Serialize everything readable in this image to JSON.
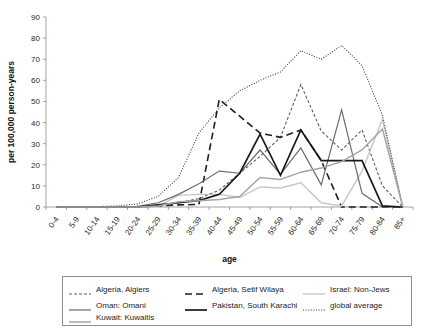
{
  "chart_data": {
    "type": "line",
    "title": "",
    "xlabel": "age",
    "ylabel": "per 100,000 person-years",
    "ylim": [
      0,
      90
    ],
    "ytick_step": 10,
    "yticks": [
      0,
      10,
      20,
      30,
      40,
      50,
      60,
      70,
      80,
      90
    ],
    "grid": false,
    "legend_position": "bottom",
    "categories": [
      "0-4",
      "5-9",
      "10-14",
      "15-19",
      "20-24",
      "25-29",
      "30-34",
      "35-39",
      "40-44",
      "45-49",
      "50-54",
      "55-59",
      "60-64",
      "65-69",
      "70-74",
      "75-79",
      "80-84",
      "85+"
    ],
    "series": [
      {
        "name": "Algeria, Algiers",
        "color": "#5e5e5e",
        "style": "dashed-dot",
        "dasharray": "3,2",
        "width": 1.1,
        "values": [
          0,
          0,
          0,
          0,
          0.3,
          1.0,
          2.0,
          4.0,
          8.0,
          16.0,
          24.0,
          33.0,
          58.0,
          36.0,
          27.0,
          36.5,
          10.0,
          0
        ]
      },
      {
        "name": "Algeria, Setif Wilaya",
        "color": "#1f1f1f",
        "style": "long-dash",
        "dasharray": "7,4",
        "width": 1.6,
        "values": [
          0,
          0,
          0,
          0,
          0,
          0.5,
          1.0,
          1.2,
          51.0,
          43.0,
          35.0,
          33.0,
          36.5,
          22.0,
          0,
          0,
          0,
          0
        ]
      },
      {
        "name": "Israel: Non-Jews",
        "color": "#c7c7c7",
        "style": "solid",
        "dasharray": "none",
        "width": 1.4,
        "values": [
          0,
          0,
          0,
          0,
          0,
          0.5,
          5.5,
          6.0,
          6.0,
          4.5,
          9.5,
          9.0,
          11.5,
          2.0,
          0.5,
          17.0,
          41.5,
          0
        ]
      },
      {
        "name": "Oman: Omani",
        "color": "#6b6b6b",
        "style": "solid",
        "dasharray": "none",
        "width": 1.2,
        "values": [
          0,
          0,
          0,
          0,
          0.3,
          2.0,
          6.0,
          11.0,
          17.0,
          16.0,
          27.0,
          15.5,
          28.0,
          10.5,
          46.0,
          6.5,
          0,
          0
        ]
      },
      {
        "name": "Pakistan, South Karachi",
        "color": "#1a1a1a",
        "style": "solid",
        "dasharray": "none",
        "width": 1.7,
        "values": [
          0,
          0,
          0,
          0,
          0,
          1.0,
          2.0,
          3.0,
          6.0,
          16.0,
          34.5,
          15.0,
          36.5,
          22.0,
          22.0,
          22.0,
          0.5,
          0
        ]
      },
      {
        "name": "global average",
        "color": "#3c3c3c",
        "style": "dotted",
        "dasharray": "1,1.6",
        "width": 1.1,
        "values": [
          0,
          0,
          0.2,
          0.5,
          1.5,
          5.0,
          14.0,
          35.0,
          47.0,
          55.0,
          60.0,
          64.0,
          74.0,
          70.0,
          76.5,
          67.0,
          43.5,
          0
        ]
      },
      {
        "name": "Kuwait: Kuwaitis",
        "color": "#a6a6a6",
        "style": "solid",
        "dasharray": "none",
        "width": 1.5,
        "values": [
          0,
          0,
          0,
          0,
          0,
          0.5,
          2.5,
          3.0,
          3.5,
          5.0,
          14.0,
          13.0,
          16.5,
          18.5,
          21.5,
          27.0,
          37.0,
          0
        ]
      }
    ]
  },
  "legend": {
    "entries": [
      {
        "label": "Algeria, Algiers",
        "series": 0
      },
      {
        "label": "Algeria, Setif Wilaya",
        "series": 1
      },
      {
        "label": "Israel: Non-Jews",
        "series": 2
      },
      {
        "label": "Oman: Omani",
        "series": 3
      },
      {
        "label": "Pakistan, South Karachi",
        "series": 4
      },
      {
        "label": "global average",
        "series": 5
      },
      {
        "label": "Kuwait: Kuwaitis",
        "series": 6
      }
    ]
  }
}
